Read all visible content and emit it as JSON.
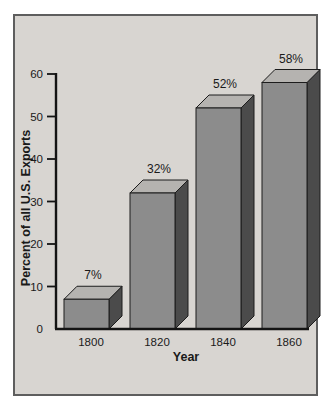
{
  "panel": {
    "background": "#d8d5d1",
    "border_color": "#5e5e5e",
    "page_background": "#ffffff"
  },
  "chart_data": {
    "type": "bar",
    "style": "3d-oblique",
    "title": "",
    "categories": [
      "1800",
      "1820",
      "1840",
      "1860"
    ],
    "values": [
      7,
      32,
      52,
      58
    ],
    "value_labels": [
      "7%",
      "32%",
      "52%",
      "58%"
    ],
    "xlabel": "Year",
    "ylabel": "Percent of all U.S. Exports",
    "ylim": [
      0,
      60
    ],
    "yticks": [
      0,
      10,
      20,
      30,
      40,
      50,
      60
    ],
    "ytick_labels": [
      "0",
      "10",
      "20",
      "30",
      "40",
      "50",
      "60"
    ],
    "grid": false,
    "legend": "none",
    "colors": {
      "bar_front": "#8c8c8c",
      "bar_side": "#4b4b4b",
      "bar_top": "#b5b3b0",
      "bar_outline": "#1c1c1c",
      "axis": "#141414",
      "text": "#1a1a1a"
    }
  }
}
